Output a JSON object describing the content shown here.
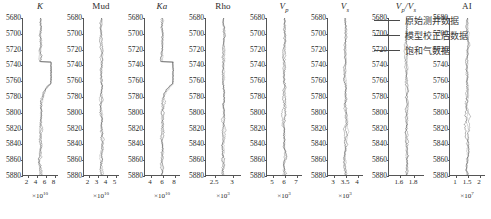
{
  "figure": {
    "kind": "well-log-panel",
    "depth_axis": {
      "label_values": [
        5680,
        5700,
        5720,
        5740,
        5760,
        5780,
        5800,
        5820,
        5840,
        5860,
        5880
      ],
      "min": 5680,
      "max": 5880,
      "step": 20,
      "direction": "increasing-downward"
    },
    "curve_color": "#3a3a3a",
    "axis_color": "#555555"
  },
  "legend": {
    "items": [
      {
        "label": "原始测井数据",
        "color": "#4a4a4a"
      },
      {
        "label": "模型校正后数据",
        "color": "#4a4a4a"
      },
      {
        "label": "饱和气数据",
        "color": "#4a4a4a"
      }
    ]
  },
  "chart_data": {
    "type": "line",
    "title": "",
    "ylabel": "",
    "xlabel": "",
    "ylim": [
      5680,
      5880
    ],
    "grid": false,
    "legend_position": "right",
    "shared_y": {
      "name": "Depth",
      "ticks": [
        5680,
        5700,
        5720,
        5740,
        5760,
        5780,
        5800,
        5820,
        5840,
        5860,
        5880
      ]
    },
    "tracks": [
      {
        "name": "K",
        "title": "K",
        "italic": true,
        "xticks": [
          2,
          4,
          6,
          8
        ],
        "xlim": [
          1,
          9
        ],
        "exponent": "×10",
        "exponent_power": "10",
        "series": [
          "原始测井数据",
          "模型校正后数据",
          "饱和气数据"
        ]
      },
      {
        "name": "Mud",
        "title": "Mud",
        "italic": false,
        "xticks": [
          2,
          3,
          4,
          5
        ],
        "xlim": [
          1.5,
          5.5
        ],
        "exponent": "×10",
        "exponent_power": "10",
        "series": [
          "原始测井数据",
          "模型校正后数据",
          "饱和气数据"
        ]
      },
      {
        "name": "Ka",
        "title": "Ka",
        "italic": true,
        "xticks": [
          4,
          6,
          8
        ],
        "xlim": [
          3,
          9
        ],
        "exponent": "×10",
        "exponent_power": "10",
        "series": [
          "原始测井数据",
          "模型校正后数据",
          "饱和气数据"
        ]
      },
      {
        "name": "Rho",
        "title": "Rho",
        "italic": false,
        "xticks": [
          2.5,
          3.0
        ],
        "xlim": [
          2.25,
          3.25
        ],
        "exponent": "×10",
        "exponent_power": "3",
        "series": [
          "原始测井数据",
          "模型校正后数据",
          "饱和气数据"
        ]
      },
      {
        "name": "Vp",
        "title": "V",
        "subscript": "p",
        "italic": true,
        "xticks": [
          5,
          6,
          7
        ],
        "xlim": [
          4.5,
          7.5
        ],
        "exponent": "×10",
        "exponent_power": "3",
        "series": [
          "原始测井数据",
          "模型校正后数据",
          "饱和气数据"
        ]
      },
      {
        "name": "Vs",
        "title": "V",
        "subscript": "s",
        "italic": true,
        "xticks": [
          3,
          3.5,
          4
        ],
        "xlim": [
          2.75,
          4.25
        ],
        "exponent": "×10",
        "exponent_power": "3",
        "series": [
          "原始测井数据",
          "模型校正后数据",
          "饱和气数据"
        ]
      },
      {
        "name": "Vp/Vs",
        "title": "V",
        "subscript": "p",
        "title2": "/V",
        "subscript2": "s",
        "italic": true,
        "xticks": [
          1.6,
          1.8
        ],
        "xlim": [
          1.45,
          1.95
        ],
        "exponent": "",
        "exponent_power": "",
        "series": [
          "原始测井数据",
          "模型校正后数据",
          "饱和气数据"
        ]
      },
      {
        "name": "AI",
        "title": "AI",
        "italic": false,
        "xticks": [
          1,
          1.5,
          2
        ],
        "xlim": [
          0.75,
          2.25
        ],
        "exponent": "×10",
        "exponent_power": "7",
        "series": [
          "原始测井数据",
          "模型校正后数据",
          "饱和气数据"
        ]
      }
    ]
  }
}
